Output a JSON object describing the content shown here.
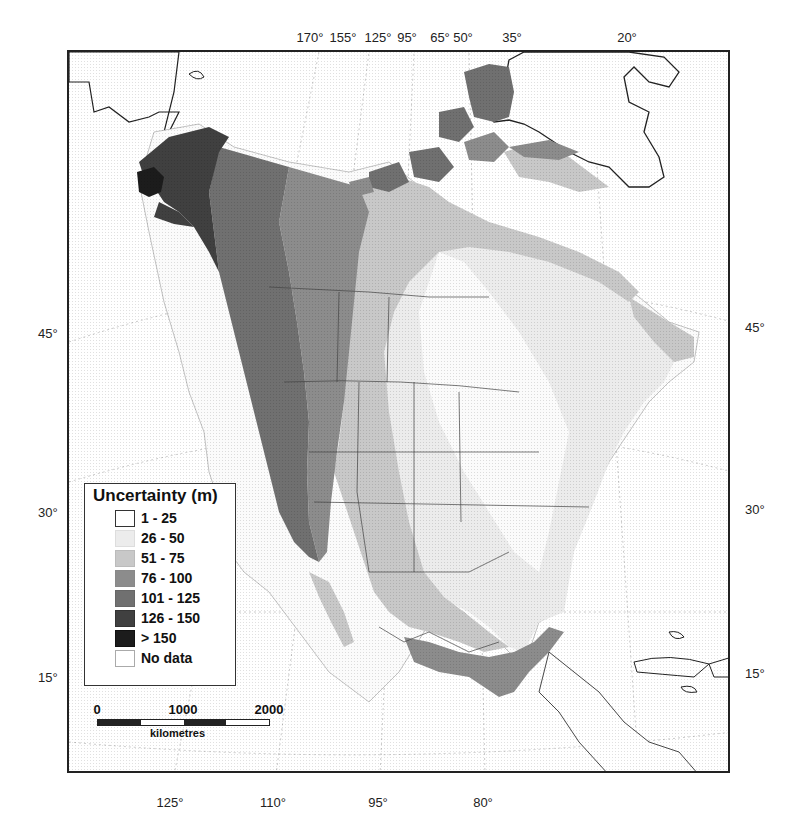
{
  "map": {
    "legend": {
      "title": "Uncertainty (m)",
      "classes": [
        {
          "label": "1 - 25",
          "color": "#ffffff"
        },
        {
          "label": "26 - 50",
          "color": "#ececec"
        },
        {
          "label": "51 - 75",
          "color": "#c8c8c8"
        },
        {
          "label": "76 - 100",
          "color": "#8c8c8c"
        },
        {
          "label": "101 - 125",
          "color": "#707070"
        },
        {
          "label": "126 - 150",
          "color": "#404040"
        },
        {
          "label": "> 150",
          "color": "#1c1c1c"
        },
        {
          "label": "No data",
          "color": "#ffffff"
        }
      ]
    },
    "scale_bar": {
      "labels": [
        "0",
        "1000",
        "2000"
      ],
      "unit": "kilometres",
      "segment_colors": [
        "#222222",
        "#ffffff",
        "#222222",
        "#ffffff"
      ]
    },
    "graticule": {
      "top_labels": [
        {
          "text": "170°",
          "x": 310
        },
        {
          "text": "155°",
          "x": 343
        },
        {
          "text": "125°",
          "x": 380
        },
        {
          "text": "95°",
          "x": 407
        },
        {
          "text": "65°",
          "x": 440
        },
        {
          "text": "50°",
          "x": 463
        },
        {
          "text": "35°",
          "x": 512
        },
        {
          "text": "20°",
          "x": 627
        }
      ],
      "bottom_labels": [
        {
          "text": "125°",
          "x": 170
        },
        {
          "text": "110°",
          "x": 273
        },
        {
          "text": "95°",
          "x": 378
        },
        {
          "text": "80°",
          "x": 483
        }
      ],
      "left_labels": [
        {
          "text": "45°",
          "y": 333
        },
        {
          "text": "30°",
          "y": 512
        },
        {
          "text": "15°",
          "y": 677
        }
      ],
      "right_labels": [
        {
          "text": "45°",
          "y": 327
        },
        {
          "text": "30°",
          "y": 509
        },
        {
          "text": "15°",
          "y": 673
        }
      ]
    }
  }
}
